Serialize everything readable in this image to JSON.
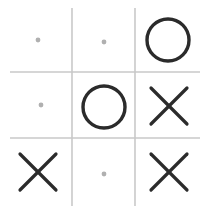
{
  "board": {
    "title": "Tic-Tac-Toe Board",
    "rows": 3,
    "columns": 3,
    "width": 209,
    "height": 214,
    "background_color": "#ffffff",
    "grid": {
      "line_color": "#c9c9c9",
      "line_width": 1.6,
      "vertical_lines_x": [
        72,
        135
      ],
      "vertical_span_y": [
        8,
        206
      ],
      "horizontal_lines_y": [
        72,
        138
      ],
      "horizontal_span_x": [
        10,
        200
      ]
    },
    "marks": {
      "circle": {
        "symbol": "O",
        "name": "nought",
        "color": "#2b2b2b",
        "stroke_width": 3.4,
        "radius": 21
      },
      "cross": {
        "symbol": "X",
        "name": "cross",
        "color": "#2b2b2b",
        "stroke_width": 3.2,
        "arm": 18
      },
      "empty": {
        "symbol": "·",
        "name": "empty",
        "color": "#b0b0b0",
        "radius": 2.4
      }
    },
    "cells": [
      {
        "id": "cell-r1c1",
        "row": 1,
        "column": 1,
        "position": "top-left",
        "mark": "empty",
        "label": "empty",
        "cx": 38,
        "cy": 40
      },
      {
        "id": "cell-r1c2",
        "row": 1,
        "column": 2,
        "position": "top-center",
        "mark": "empty",
        "label": "empty",
        "cx": 104,
        "cy": 42
      },
      {
        "id": "cell-r1c3",
        "row": 1,
        "column": 3,
        "position": "top-right",
        "mark": "circle",
        "label": "O",
        "cx": 168,
        "cy": 40
      },
      {
        "id": "cell-r2c1",
        "row": 2,
        "column": 1,
        "position": "middle-left",
        "mark": "empty",
        "label": "empty",
        "cx": 41,
        "cy": 105
      },
      {
        "id": "cell-r2c2",
        "row": 2,
        "column": 2,
        "position": "middle-center",
        "mark": "circle",
        "label": "O",
        "cx": 104,
        "cy": 107
      },
      {
        "id": "cell-r2c3",
        "row": 2,
        "column": 3,
        "position": "middle-right",
        "mark": "cross",
        "label": "X",
        "cx": 169,
        "cy": 106
      },
      {
        "id": "cell-r3c1",
        "row": 3,
        "column": 1,
        "position": "bottom-left",
        "mark": "cross",
        "label": "X",
        "cx": 38,
        "cy": 172
      },
      {
        "id": "cell-r3c2",
        "row": 3,
        "column": 2,
        "position": "bottom-center",
        "mark": "empty",
        "label": "empty",
        "cx": 104,
        "cy": 174
      },
      {
        "id": "cell-r3c3",
        "row": 3,
        "column": 3,
        "position": "bottom-right",
        "mark": "cross",
        "label": "X",
        "cx": 169,
        "cy": 172
      }
    ]
  }
}
